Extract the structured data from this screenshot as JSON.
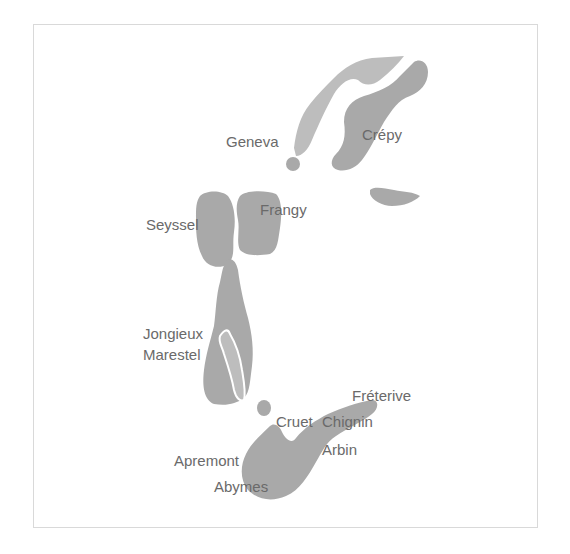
{
  "map": {
    "colors": {
      "region_fill": "#a9a9a9",
      "region_light_fill": "#bdbdbd",
      "label_color": "#6a6a6a",
      "frame_border": "#d9d9d9"
    },
    "labels": {
      "geneva": "Geneva",
      "crepy": "Crépy",
      "frangy": "Frangy",
      "seyssel": "Seyssel",
      "jongieux": "Jongieux",
      "marestel": "Marestel",
      "freterive": "Fréterive",
      "cruet": "Cruet",
      "chignin": "Chignin",
      "arbin": "Arbin",
      "apremont": "Apremont",
      "abymes": "Abymes"
    }
  }
}
